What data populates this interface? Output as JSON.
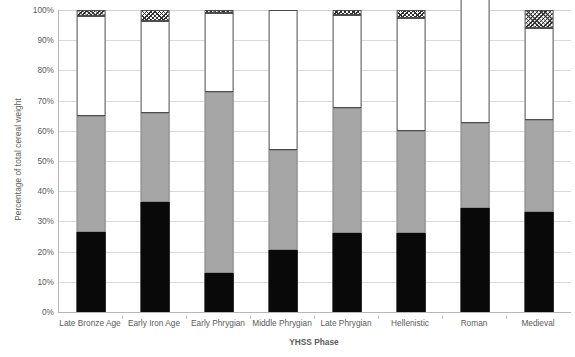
{
  "chart_data": {
    "type": "bar",
    "subtype": "stacked-bar-100-percent",
    "title": "",
    "xlabel": "YHSS Phase",
    "ylabel": "Percentage of total cereal weight",
    "ylim": [
      0,
      100
    ],
    "yticks": [
      "0%",
      "10%",
      "20%",
      "30%",
      "40%",
      "50%",
      "60%",
      "70%",
      "80%",
      "90%",
      "100%"
    ],
    "ytick_values": [
      0,
      10,
      20,
      30,
      40,
      50,
      60,
      70,
      80,
      90,
      100
    ],
    "grid": true,
    "legend": "none",
    "categories": [
      "Late Bronze Age",
      "Early Iron Age",
      "Early Phrygian",
      "Middle Phrygian",
      "Late Phrygian",
      "Hellenistic",
      "Roman",
      "Medieval"
    ],
    "series": [
      {
        "name": "black",
        "fill": "#090909",
        "values": [
          26.5,
          36.5,
          13.0,
          20.5,
          26.0,
          26.0,
          34.5,
          33.0
        ]
      },
      {
        "name": "gray",
        "fill": "#a6a6a6",
        "values": [
          38.5,
          29.5,
          60.0,
          33.0,
          41.5,
          34.0,
          28.0,
          30.5
        ]
      },
      {
        "name": "white",
        "fill": "#ffffff",
        "values": [
          33.0,
          30.5,
          26.0,
          46.5,
          31.0,
          37.5,
          65.5,
          30.5
        ]
      },
      {
        "name": "hatched",
        "fill": "crosshatch",
        "values": [
          2.0,
          3.5,
          1.0,
          0.0,
          1.5,
          2.5,
          0.0,
          6.0
        ]
      }
    ],
    "cumulative_tops": {
      "black": [
        26.5,
        36.5,
        13.0,
        20.5,
        26.0,
        26.0,
        34.5,
        33.0
      ],
      "gray": [
        65.0,
        66.0,
        73.0,
        53.5,
        67.5,
        60.0,
        62.5,
        63.5
      ],
      "white": [
        98.0,
        96.5,
        99.0,
        100.0,
        98.5,
        97.5,
        100.0,
        94.0
      ],
      "hatched": [
        100.0,
        100.0,
        100.0,
        100.0,
        100.0,
        100.0,
        100.0,
        100.0
      ]
    }
  },
  "axes": {
    "y_title": "Percentage of total cereal weight",
    "x_title": "YHSS Phase"
  },
  "colors": {
    "black_segment": "#090909",
    "gray_segment": "#a6a6a6",
    "white_segment": "#ffffff",
    "hatch_stroke": "#2f2f2f",
    "gridline": "#d9d9d9",
    "axis_line": "#b6b6b6",
    "text": "#5a5a5a"
  }
}
